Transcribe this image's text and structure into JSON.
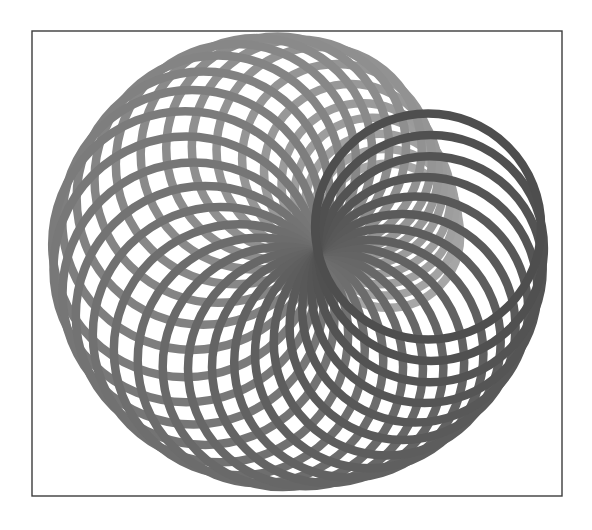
{
  "figure": {
    "background": "#ffffff",
    "frame": {
      "x": 32,
      "y": 31,
      "width": 530,
      "height": 465,
      "stroke": "#3c3c3c"
    }
  },
  "pattern": {
    "common_point": [
      318,
      252
    ],
    "circle_count": 34,
    "stroke_width": 8.5,
    "start_angle_deg": 347,
    "end_angle_deg": -13,
    "radius_profile": [
      [
        -13,
        113
      ],
      [
        0,
        113
      ],
      [
        45,
        113
      ],
      [
        90,
        116
      ],
      [
        135,
        127
      ],
      [
        180,
        134
      ],
      [
        225,
        121
      ],
      [
        270,
        103
      ],
      [
        300,
        82
      ],
      [
        330,
        74
      ],
      [
        347,
        72
      ]
    ],
    "color_back": "#a6a6a6",
    "color_mid": "#777777",
    "color_front": "#4e4e4e"
  }
}
